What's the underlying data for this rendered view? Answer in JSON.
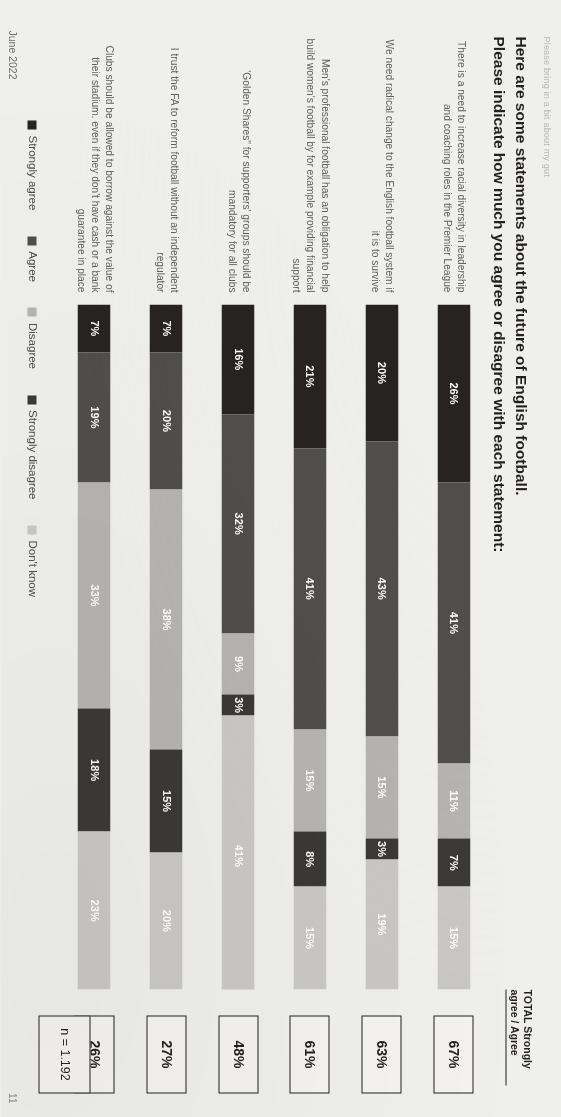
{
  "slide": {
    "kicker": "Please bring in a bit about my gut",
    "title_line1": "Here are some statements about the future of English football.",
    "title_line2": "Please indicate how much you agree or disagree with each statement:",
    "footer_date": "June 2022",
    "page_number": "11",
    "sample_note": "n = 1.192",
    "total_header_line1": "TOTAL Strongly",
    "total_header_line2": "agree / Agree"
  },
  "colors": {
    "strongly_agree": "#262322",
    "agree": "#4f4e4c",
    "disagree": "#b5b4b0",
    "strongly_disagree": "#3a3937",
    "dont_know": "#c9c8c4",
    "paper": "#efefed",
    "ink": "#231f20"
  },
  "chart_data": {
    "type": "bar",
    "subtype": "stacked-horizontal-100",
    "title": "Here are some statements about the future of English football. Please indicate how much you agree or disagree with each statement:",
    "xlabel": "",
    "ylabel": "",
    "xlim": [
      0,
      100
    ],
    "grid": false,
    "legend_position": "bottom",
    "unit": "%",
    "sample_size": "n = 1.192",
    "legend": [
      {
        "name": "Strongly agree",
        "color": "#262322"
      },
      {
        "name": "Agree",
        "color": "#4f4e4c"
      },
      {
        "name": "Disagree",
        "color": "#b5b4b0"
      },
      {
        "name": "Strongly disagree",
        "color": "#3a3937"
      },
      {
        "name": "Don't know",
        "color": "#c9c8c4"
      }
    ],
    "categories": [
      "There is a need to increase racial diversity in leadership and coaching roles in the Premier League",
      "We need radical change to the English football system if it is to survive",
      "Men's professional football has an obligation to help build women's football by for example providing financial support",
      "'Golden Shares\" for supporters' groups should be mandatory for all clubs",
      "I trust the FA to reform football without an independent regulator",
      "Clubs should be allowed to borrow against the value of their stadium. even if they don't have cash or a bank guarantee in place"
    ],
    "series": [
      {
        "name": "Strongly agree",
        "values": [
          26,
          20,
          21,
          16,
          7,
          7
        ]
      },
      {
        "name": "Agree",
        "values": [
          41,
          43,
          41,
          32,
          20,
          19
        ]
      },
      {
        "name": "Disagree",
        "values": [
          11,
          15,
          15,
          9,
          38,
          33
        ]
      },
      {
        "name": "Strongly disagree",
        "values": [
          7,
          3,
          8,
          3,
          15,
          18
        ]
      },
      {
        "name": "Don't know",
        "values": [
          15,
          19,
          15,
          41,
          20,
          23
        ]
      }
    ],
    "totals_label": "TOTAL Strongly agree / Agree",
    "totals": [
      "67%",
      "63%",
      "61%",
      "48%",
      "27%",
      "26%"
    ]
  },
  "rows": [
    {
      "label": "There is a need to increase racial diversity in leadership and coaching roles in the Premier League",
      "total": "67%",
      "segments": [
        {
          "key": "strongly_agree",
          "value": 26,
          "label": "26%"
        },
        {
          "key": "agree",
          "value": 41,
          "label": "41%"
        },
        {
          "key": "disagree",
          "value": 11,
          "label": "11%"
        },
        {
          "key": "strongly_disagree",
          "value": 7,
          "label": "7%"
        },
        {
          "key": "dont_know",
          "value": 15,
          "label": "15%"
        }
      ]
    },
    {
      "label": "We need radical change to the English football system if it is to survive",
      "total": "63%",
      "segments": [
        {
          "key": "strongly_agree",
          "value": 20,
          "label": "20%"
        },
        {
          "key": "agree",
          "value": 43,
          "label": "43%"
        },
        {
          "key": "disagree",
          "value": 15,
          "label": "15%"
        },
        {
          "key": "strongly_disagree",
          "value": 3,
          "label": "3%"
        },
        {
          "key": "dont_know",
          "value": 19,
          "label": "19%"
        }
      ]
    },
    {
      "label": "Men's professional football has an obligation to help build women's football by for example providing financial support",
      "total": "61%",
      "segments": [
        {
          "key": "strongly_agree",
          "value": 21,
          "label": "21%"
        },
        {
          "key": "agree",
          "value": 41,
          "label": "41%"
        },
        {
          "key": "disagree",
          "value": 15,
          "label": "15%"
        },
        {
          "key": "strongly_disagree",
          "value": 8,
          "label": "8%"
        },
        {
          "key": "dont_know",
          "value": 15,
          "label": "15%"
        }
      ]
    },
    {
      "label": "'Golden Shares\" for supporters' groups should be mandatory for all clubs",
      "total": "48%",
      "segments": [
        {
          "key": "strongly_agree",
          "value": 16,
          "label": "16%"
        },
        {
          "key": "agree",
          "value": 32,
          "label": "32%"
        },
        {
          "key": "disagree",
          "value": 9,
          "label": "9%"
        },
        {
          "key": "strongly_disagree",
          "value": 3,
          "label": "3%"
        },
        {
          "key": "dont_know",
          "value": 41,
          "label": "41%"
        }
      ]
    },
    {
      "label": "I trust the FA to reform football without an independent regulator",
      "total": "27%",
      "segments": [
        {
          "key": "strongly_agree",
          "value": 7,
          "label": "7%"
        },
        {
          "key": "agree",
          "value": 20,
          "label": "20%"
        },
        {
          "key": "disagree",
          "value": 38,
          "label": "38%"
        },
        {
          "key": "strongly_disagree",
          "value": 15,
          "label": "15%"
        },
        {
          "key": "dont_know",
          "value": 20,
          "label": "20%"
        }
      ]
    },
    {
      "label": "Clubs should be allowed to borrow against the value of their stadium. even if they don't have cash or a bank guarantee in place",
      "total": "26%",
      "segments": [
        {
          "key": "strongly_agree",
          "value": 7,
          "label": "7%"
        },
        {
          "key": "agree",
          "value": 19,
          "label": "19%"
        },
        {
          "key": "disagree",
          "value": 33,
          "label": "33%"
        },
        {
          "key": "strongly_disagree",
          "value": 18,
          "label": "18%"
        },
        {
          "key": "dont_know",
          "value": 23,
          "label": "23%"
        }
      ]
    }
  ]
}
